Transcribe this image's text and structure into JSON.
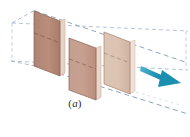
{
  "figure": {
    "name": "three-parallel-wavefront-sheets",
    "caption": "(a)",
    "caption_prefix": "(",
    "caption_letter": "a",
    "caption_suffix": ")",
    "background_color": "#ffffff"
  },
  "colors": {
    "panel_front_dark": "#b08878",
    "panel_front_mid": "#c29c8c",
    "panel_front_light": "#d9bfae",
    "panel_edge": "#8d6050",
    "panel_side": "#e2cdbf",
    "dashed_line": "#9fb4cc",
    "dashed_line_dark": "#6a7c91",
    "arrow": "#2196b4",
    "arrow_light": "#59bcd6",
    "label_text": "#2b2b2b"
  },
  "panels": [
    {
      "id": "panel-1",
      "label": "wavefront-sheet-rear",
      "fill": "#b08878",
      "points": "34,10 60,21 60,76 34,65",
      "side_points": "60,21 65,19 65,74 60,76",
      "side_fill": "#e0cabb"
    },
    {
      "id": "panel-2",
      "label": "wavefront-sheet-middle",
      "fill": "#c09a8a",
      "points": "69,37 96,48 96,100 69,90",
      "side_points": "96,48 101,46 101,98 96,100",
      "side_fill": "#e2cdbf"
    },
    {
      "id": "panel-3",
      "label": "wavefront-sheet-front",
      "fill": "#d9c0b0",
      "points": "104,31 130,42 130,94 104,83",
      "side_points": "130,42 135,40 135,92 130,94",
      "side_fill": "#eadcd1"
    }
  ],
  "guide_lines": [
    {
      "id": "guide-top-back",
      "name": "dashed-guide-top-rear",
      "x1": 12,
      "y1": 22,
      "x2": 186,
      "y2": 30
    },
    {
      "id": "guide-top-front",
      "name": "dashed-guide-top-front",
      "x1": 48,
      "y1": 8,
      "x2": 186,
      "y2": 62
    },
    {
      "id": "guide-mid",
      "name": "dashed-guide-middle",
      "x1": 18,
      "y1": 32,
      "x2": 186,
      "y2": 66
    },
    {
      "id": "guide-bot-back",
      "name": "dashed-guide-bottom-rear",
      "x1": 12,
      "y1": 60,
      "x2": 186,
      "y2": 70
    },
    {
      "id": "guide-bot-front",
      "name": "dashed-guide-bottom-front",
      "x1": 14,
      "y1": 72,
      "x2": 186,
      "y2": 112
    }
  ],
  "arrow": {
    "name": "propagation-direction-arrow",
    "color": "#2196b4",
    "from_x": 142,
    "from_y": 68,
    "to_x": 178,
    "to_y": 85,
    "direction": "down-right",
    "meaning": "direction of propagation"
  }
}
